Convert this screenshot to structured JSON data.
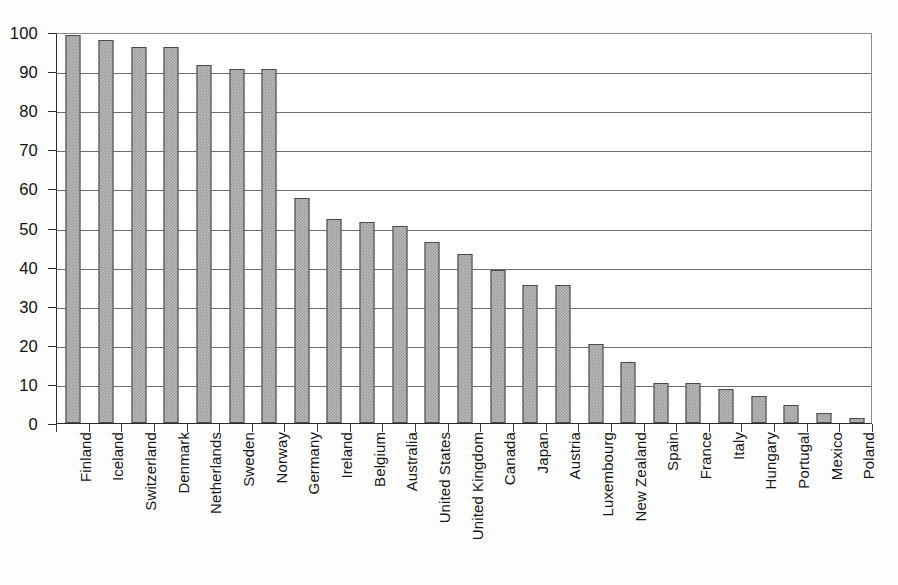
{
  "chart_data": {
    "type": "bar",
    "title": "",
    "subtitle": "",
    "xlabel": "",
    "ylabel": "",
    "ylim": [
      0,
      100
    ],
    "grid": true,
    "legend": false,
    "orientation": "vertical",
    "bar_color": "#9c9c9c",
    "bar_border_color": "#4a4a4a",
    "gridline_color": "#6e6e6e",
    "axis_color": "#2b2b2b",
    "y_ticks": [
      0,
      10,
      20,
      30,
      40,
      50,
      60,
      70,
      80,
      90,
      100
    ],
    "y_tick_labels": [
      "0",
      "10",
      "20",
      "30",
      "40",
      "50",
      "60",
      "70",
      "80",
      "90",
      "100"
    ],
    "categories": [
      "Finland",
      "Iceland",
      "Switzerland",
      "Denmark",
      "Netherlands",
      "Sweden",
      "Norway",
      "Germany",
      "Ireland",
      "Belgium",
      "Australia",
      "United States",
      "United Kingdom",
      "Canada",
      "Japan",
      "Austria",
      "Luxembourg",
      "New Zealand",
      "Spain",
      "France",
      "Italy",
      "Hungary",
      "Portugal",
      "Mexico",
      "Poland"
    ],
    "values": [
      99.2,
      98.0,
      96.1,
      96.1,
      91.5,
      90.6,
      90.6,
      57.5,
      52.3,
      51.4,
      50.3,
      46.3,
      43.2,
      39.2,
      35.2,
      35.2,
      20.3,
      15.5,
      10.2,
      10.2,
      8.7,
      6.8,
      4.7,
      2.5,
      1.3
    ]
  }
}
